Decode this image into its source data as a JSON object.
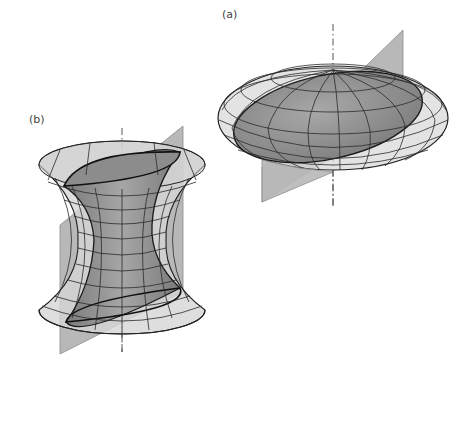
{
  "figure": {
    "panels": [
      {
        "id": "a",
        "label": "(a)",
        "label_pos": [
          222,
          8
        ],
        "shape": "ellipsoid",
        "description": "Oblate ellipsoid with a tilted plane through its axis and an inclined elliptical cross-section",
        "center": [
          333,
          118
        ],
        "rx": 115,
        "ry": 52,
        "axis": {
          "x": 333,
          "y1": 24,
          "y2": 206
        },
        "plane": [
          [
            262,
            167
          ],
          [
            403,
            30
          ],
          [
            403,
            112
          ],
          [
            262,
            202
          ]
        ],
        "section": {
          "cx": 328,
          "cy": 117,
          "rx": 96,
          "ry": 42,
          "rotate": -12
        }
      },
      {
        "id": "b",
        "label": "(b)",
        "label_pos": [
          29,
          113
        ],
        "shape": "hyperboloid",
        "description": "Hyperboloid of one sheet with a tilted plane through its axis and an inclined elliptical cross-section",
        "center_x": 122,
        "top": {
          "cy": 165,
          "rx": 83,
          "ry": 24
        },
        "bottom": {
          "cy": 310,
          "rx": 83,
          "ry": 24
        },
        "waist": {
          "cy": 240,
          "rx": 44
        },
        "axis": {
          "x": 122,
          "y1": 128,
          "y2": 352
        },
        "plane": [
          [
            60,
            225
          ],
          [
            183,
            126
          ],
          [
            183,
            292
          ],
          [
            60,
            354
          ]
        ],
        "section": {
          "top": [
            [
              64,
              186
            ],
            [
              180,
              152
            ]
          ],
          "bottom": [
            [
              66,
              322
            ],
            [
              180,
              288
            ]
          ]
        }
      }
    ],
    "colors": {
      "background": "#ffffff",
      "plane": "#b4b4b4",
      "surface_light": "#d8d8d8",
      "surface_dark": "#8a8a8a",
      "grid_line": "#2a2a2a",
      "axis_line": "#555555"
    }
  }
}
